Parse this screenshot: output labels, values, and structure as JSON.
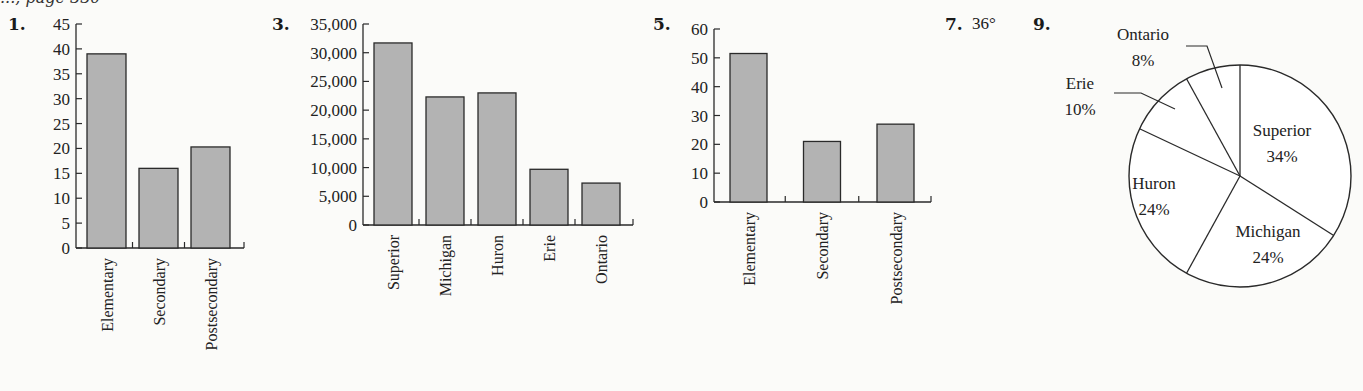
{
  "header": {
    "fragment": "..., page 330"
  },
  "problems": [
    {
      "number": "1.",
      "x": 8,
      "y": 14
    },
    {
      "number": "3.",
      "x": 272,
      "y": 14
    },
    {
      "number": "5.",
      "x": 653,
      "y": 14
    },
    {
      "number": "7.",
      "x": 945,
      "y": 14
    },
    {
      "number": "9.",
      "x": 1033,
      "y": 14
    }
  ],
  "answer_7": {
    "label": "7.",
    "value": "36°"
  },
  "colors": {
    "bar_fill": "#b3b3b3",
    "bar_stroke": "#2a2a2a",
    "axis": "#2a2a2a",
    "pie_fill": "#ffffff",
    "pie_stroke": "#2a2a2a"
  },
  "chart_data": [
    {
      "id": "problem-1",
      "type": "bar",
      "title": "",
      "xlabel": "",
      "ylabel": "",
      "categories": [
        "Elementary",
        "Secondary",
        "Postsecondary"
      ],
      "values": [
        39,
        16,
        20.3
      ],
      "ylim": [
        0,
        45
      ],
      "yticks": [
        0,
        5,
        10,
        15,
        20,
        25,
        30,
        35,
        40,
        45
      ],
      "ytick_labels": [
        "0",
        "5",
        "10",
        "15",
        "20",
        "25",
        "30",
        "35",
        "40",
        "45"
      ],
      "grid": false,
      "legend": null,
      "layout": {
        "axis_x": 76,
        "zero_y": 248,
        "top_y": 24,
        "bar_start": 87,
        "bar_width": 39,
        "bar_step": 52,
        "axis_end": 244,
        "label_font": 16
      }
    },
    {
      "id": "problem-3",
      "type": "bar",
      "title": "",
      "xlabel": "",
      "ylabel": "",
      "categories": [
        "Superior",
        "Michigan",
        "Huron",
        "Erie",
        "Ontario"
      ],
      "values": [
        31700,
        22300,
        23000,
        9700,
        7300
      ],
      "ylim": [
        0,
        35000
      ],
      "yticks": [
        0,
        5000,
        10000,
        15000,
        20000,
        25000,
        30000,
        35000
      ],
      "ytick_labels": [
        "0",
        "5,000",
        "10,000",
        "15,000",
        "20,000",
        "25,000",
        "30,000",
        "35,000"
      ],
      "grid": false,
      "legend": null,
      "layout": {
        "axis_x": 363,
        "zero_y": 225,
        "top_y": 24,
        "bar_start": 374,
        "bar_width": 38,
        "bar_step": 52,
        "axis_end": 633,
        "label_font": 16
      }
    },
    {
      "id": "problem-5",
      "type": "bar",
      "title": "",
      "xlabel": "",
      "ylabel": "",
      "categories": [
        "Elementary",
        "Secondary",
        "Postsecondary"
      ],
      "values": [
        51.5,
        21,
        27
      ],
      "ylim": [
        0,
        60
      ],
      "yticks": [
        0,
        10,
        20,
        30,
        40,
        50,
        60
      ],
      "ytick_labels": [
        "0",
        "10",
        "20",
        "30",
        "40",
        "50",
        "60"
      ],
      "grid": false,
      "legend": null,
      "layout": {
        "axis_x": 714,
        "zero_y": 202,
        "top_y": 29,
        "bar_start": 730,
        "bar_width": 37,
        "bar_step": 73.5,
        "axis_end": 931,
        "label_font": 16
      }
    },
    {
      "id": "problem-9",
      "type": "pie",
      "title": "",
      "categories": [
        "Superior",
        "Michigan",
        "Huron",
        "Erie",
        "Ontario"
      ],
      "values": [
        34,
        24,
        24,
        10,
        8
      ],
      "labels": [
        "Superior 34%",
        "Michigan 24%",
        "Huron 24%",
        "Erie 10%",
        "Ontario 8%"
      ],
      "start_angle_deg": 0,
      "direction": "clockwise-from-top",
      "legend": null,
      "layout": {
        "cx": 1240,
        "cy": 176,
        "r": 111
      }
    }
  ],
  "pie_labels": [
    {
      "name": "Superior",
      "pct": "34%",
      "x": 1282,
      "y": 136,
      "y2": 162,
      "inside": true
    },
    {
      "name": "Michigan",
      "pct": "24%",
      "x": 1268,
      "y": 237,
      "y2": 263,
      "inside": true
    },
    {
      "name": "Huron",
      "pct": "24%",
      "x": 1154,
      "y": 189,
      "y2": 215,
      "inside": true
    },
    {
      "name": "Erie",
      "pct": "10%",
      "x": 1080,
      "y": 89,
      "y2": 115,
      "inside": false
    },
    {
      "name": "Ontario",
      "pct": "8%",
      "x": 1143,
      "y": 40,
      "y2": 66,
      "inside": false
    }
  ],
  "pie_leaders": [
    {
      "name": "Erie",
      "points": "1114,93 1141,93 1175,109"
    },
    {
      "name": "Ontario",
      "points": "1186,46 1207,46 1222,88"
    }
  ]
}
